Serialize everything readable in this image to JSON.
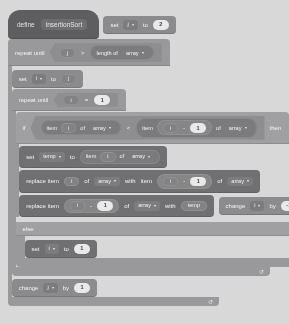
{
  "editor": {
    "background_color": "#d8d8d8",
    "palette": {
      "custom_block": "#5a5a6a",
      "variables": "#8b8b99",
      "control": "#9a9aa6",
      "operators": "#7e7e8c",
      "lists": "#6e6e7e",
      "number_input": "#f2f2f2"
    }
  },
  "script": {
    "definition": {
      "keyword": "define",
      "procedure_name": "insertionSort"
    },
    "blocks": [
      {
        "id": "set-j",
        "opcode": "set-variable",
        "label_set": "set",
        "variable": "j",
        "label_to": "to",
        "value": "2"
      },
      {
        "id": "repeat-until-outer",
        "opcode": "repeat-until",
        "label": "repeat until",
        "condition": {
          "left": "j",
          "operator": ">",
          "right": {
            "opcode": "length-of-list",
            "label": "length of",
            "list": "array"
          }
        },
        "loop_arrow": "↺"
      },
      {
        "id": "set-i",
        "opcode": "set-variable",
        "label_set": "set",
        "variable": "i",
        "label_to": "to",
        "value": "j"
      },
      {
        "id": "repeat-until-inner",
        "opcode": "repeat-until",
        "label": "repeat until",
        "condition": {
          "left": "i",
          "operator": "=",
          "right": "1"
        },
        "loop_arrow": "↺"
      },
      {
        "id": "if-else",
        "opcode": "if-else",
        "label_if": "if",
        "label_then": "then",
        "label_else": "else",
        "condition": {
          "left": {
            "opcode": "item-of-list",
            "label_item": "item",
            "index": "i",
            "label_of": "of",
            "list": "array"
          },
          "operator": "<",
          "right": {
            "opcode": "item-of-list",
            "label_item": "item",
            "index": {
              "left": "i",
              "operator": "-",
              "right": "1"
            },
            "label_of": "of",
            "list": "array"
          }
        }
      },
      {
        "id": "set-temp",
        "opcode": "set-variable",
        "label_set": "set",
        "variable": "temp",
        "label_to": "to",
        "value": {
          "opcode": "item-of-list",
          "label_item": "item",
          "index": "i",
          "label_of": "of",
          "list": "array"
        }
      },
      {
        "id": "replace-i",
        "opcode": "replace-item",
        "label_replace": "replace item",
        "index": "i",
        "label_of": "of",
        "list": "array",
        "label_with": "with",
        "value": {
          "opcode": "item-of-list",
          "label_item": "item",
          "index": {
            "left": "i",
            "operator": "-",
            "right": "1"
          },
          "label_of": "of",
          "list": "array"
        }
      },
      {
        "id": "replace-i-minus-1",
        "opcode": "replace-item",
        "label_replace": "replace item",
        "index": {
          "left": "i",
          "operator": "-",
          "right": "1"
        },
        "label_of": "of",
        "list": "array",
        "label_with": "with",
        "value": "temp"
      },
      {
        "id": "change-i",
        "opcode": "change-variable",
        "label_change": "change",
        "variable": "i",
        "label_by": "by",
        "value": "-1"
      },
      {
        "id": "set-i-one",
        "opcode": "set-variable",
        "label_set": "set",
        "variable": "i",
        "label_to": "to",
        "value": "1"
      },
      {
        "id": "change-j",
        "opcode": "change-variable",
        "label_change": "change",
        "variable": "j",
        "label_by": "by",
        "value": "1"
      }
    ]
  }
}
